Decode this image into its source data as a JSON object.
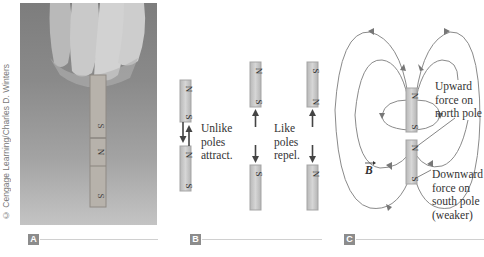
{
  "figure": {
    "panels": [
      {
        "id": "A",
        "label": "A",
        "type": "photo",
        "credit": "© Cengage Learning/Charles D. Winters",
        "magnet_stack": [
          "S",
          "N",
          "S"
        ]
      },
      {
        "id": "B",
        "label": "B",
        "type": "diagram",
        "captions": {
          "attract": [
            "Unlike",
            "poles",
            "attract."
          ],
          "repel": [
            "Like",
            "poles",
            "repel."
          ]
        },
        "pairs": [
          {
            "top": [
              "N",
              "S"
            ],
            "bottom": [
              "N",
              "S"
            ],
            "interaction": "attract"
          },
          {
            "top": [
              "N",
              "S"
            ],
            "bottom": [
              "S",
              "N"
            ],
            "interaction": "repel"
          },
          {
            "top": [
              "S",
              "N"
            ],
            "bottom": [
              "N",
              "S"
            ],
            "interaction": "repel"
          }
        ]
      },
      {
        "id": "C",
        "label": "C",
        "type": "field-diagram",
        "field_symbol": "B",
        "annotations": {
          "upward": [
            "Upward",
            "force on",
            "north pole"
          ],
          "downward": [
            "Downward",
            "force on",
            "south pole",
            "(weaker)"
          ]
        },
        "magnets": [
          {
            "top": "N",
            "bottom": "S"
          },
          {
            "top": "N",
            "bottom": "S"
          }
        ]
      }
    ],
    "colors": {
      "label_box": "#8c8c8c",
      "field_line": "#8a8a8a",
      "arrow": "#444444",
      "magnet": "#c8c8c8",
      "text": "#333333"
    }
  }
}
